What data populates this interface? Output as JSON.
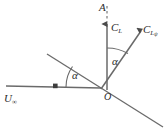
{
  "figure": {
    "type": "vector-diagram",
    "background_color": "#ffffff",
    "line_color": "#555555",
    "text_color": "#2b2b2b",
    "width": 167,
    "height": 131
  },
  "labels": {
    "axis_top": "A",
    "lift_vector": "C",
    "lift_vector_sub": "L",
    "lift_psi_vector": "C",
    "lift_psi_vector_sub": "L",
    "lift_psi_vector_subsub": "ψ",
    "freestream": "U",
    "freestream_sub": "∞",
    "origin": "O",
    "angle_lower": "α",
    "angle_upper": "α"
  },
  "geometry": {
    "origin": {
      "x": 101,
      "y": 90
    },
    "vertical_axis": {
      "name": "A-axis",
      "x": 107,
      "dashed_from_y": 8,
      "dashed_to_y": 22,
      "solid_from_y": 22,
      "solid_to_y": 90,
      "arrow": "up"
    },
    "lift_psi_arrow": {
      "from": {
        "x": 101,
        "y": 90
      },
      "to": {
        "x": 141,
        "y": 29
      },
      "arrow": "up-right"
    },
    "freestream_arrow": {
      "from": {
        "x": 6,
        "y": 86
      },
      "to": {
        "x": 101,
        "y": 86
      },
      "arrow_marker_x": 56
    },
    "chord_line": {
      "from": {
        "x": 47,
        "y": 54
      },
      "to": {
        "x": 162,
        "y": 126
      }
    },
    "angle_arc_lower": {
      "center": {
        "x": 101,
        "y": 87
      },
      "radius": 36
    },
    "angle_arc_upper": {
      "center": {
        "x": 101,
        "y": 90
      },
      "radius": 42
    }
  }
}
